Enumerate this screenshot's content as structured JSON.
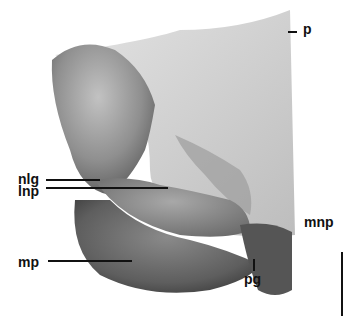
{
  "figure": {
    "labels": {
      "p": "p",
      "nlg": "nlg",
      "lnp": "lnp",
      "mp": "mp",
      "mnp": "mnp",
      "pg": "pg"
    },
    "scale_bar": "vertical scale bar, lower right",
    "colors": {
      "background": "#ffffff",
      "light_plate": "#d4d4d4",
      "mid": "#9a9a9a",
      "dark": "#4a4a4a",
      "ink": "#111111"
    }
  }
}
